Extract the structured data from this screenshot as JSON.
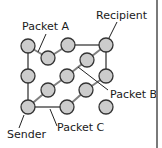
{
  "diagram": {
    "type": "packet-switching-network",
    "colors": {
      "node_fill": "#cccccc",
      "node_stroke": "#333333",
      "edge": "#7f7f7f",
      "leader": "#222222",
      "border": "#7a7a7a"
    },
    "labels": {
      "packet_a": "Packet A",
      "recipient": "Recipient",
      "packet_b": "Packet B",
      "sender": "Sender",
      "packet_c": "Packet C"
    },
    "nodes": [
      {
        "id": "n1",
        "cx": 28,
        "cy": 46
      },
      {
        "id": "n2",
        "cx": 48,
        "cy": 58
      },
      {
        "id": "n3",
        "cx": 68,
        "cy": 45
      },
      {
        "id": "recipient",
        "cx": 106,
        "cy": 45
      },
      {
        "id": "n5",
        "cx": 87,
        "cy": 60
      },
      {
        "id": "n6",
        "cx": 28,
        "cy": 76
      },
      {
        "id": "n7",
        "cx": 67,
        "cy": 76
      },
      {
        "id": "n8",
        "cx": 106,
        "cy": 76
      },
      {
        "id": "n9",
        "cx": 48,
        "cy": 90
      },
      {
        "id": "n10",
        "cx": 86,
        "cy": 90
      },
      {
        "id": "sender",
        "cx": 28,
        "cy": 107
      },
      {
        "id": "n12",
        "cx": 67,
        "cy": 107
      },
      {
        "id": "n13",
        "cx": 106,
        "cy": 107
      }
    ],
    "edges": [
      [
        "n1",
        "n6"
      ],
      [
        "n6",
        "sender"
      ],
      [
        "n1",
        "n2"
      ],
      [
        "n2",
        "n3"
      ],
      [
        "n3",
        "recipient"
      ],
      [
        "recipient",
        "n8"
      ],
      [
        "recipient",
        "n5"
      ],
      [
        "n5",
        "n7"
      ],
      [
        "n7",
        "n9"
      ],
      [
        "n9",
        "sender"
      ],
      [
        "sender",
        "n12"
      ],
      [
        "n12",
        "n10"
      ],
      [
        "n10",
        "n8"
      ]
    ]
  }
}
